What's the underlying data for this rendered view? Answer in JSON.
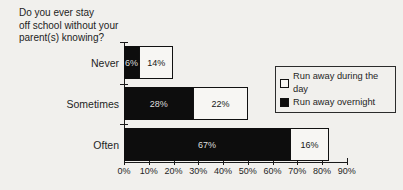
{
  "title": "Do you ever stay\noff school without your\nparent(s) knowing?",
  "legend": {
    "items": [
      {
        "label": "Run away during the day",
        "swatch_fill": "#f7f6f3"
      },
      {
        "label": "Run away overnight",
        "swatch_fill": "#0d0d0d"
      }
    ]
  },
  "colors": {
    "background": "#f1f0ed",
    "bar_overnight": "#0d0d0d",
    "bar_day": "#f7f6f3",
    "bar_border": "#111111",
    "axis": "#1a1a1a",
    "text": "#1c1c1c",
    "label_on_black": "#dedede",
    "label_on_white": "#161616"
  },
  "chart_data": {
    "type": "bar",
    "orientation": "horizontal",
    "stacked": true,
    "title": "Do you ever stay off school without your parent(s) knowing?",
    "categories": [
      "Never",
      "Sometimes",
      "Often"
    ],
    "series": [
      {
        "name": "Run away overnight",
        "fill": "black",
        "values": [
          6,
          28,
          67
        ],
        "labels": [
          "6%",
          "28%",
          "67%"
        ]
      },
      {
        "name": "Run away during the day",
        "fill": "white",
        "values": [
          14,
          22,
          16
        ],
        "labels": [
          "14%",
          "22%",
          "16%"
        ]
      }
    ],
    "xlim": [
      0,
      90
    ],
    "x_ticks": [
      "0%",
      "10%",
      "20%",
      "30%",
      "40%",
      "50%",
      "60%",
      "70%",
      "80%",
      "90%"
    ],
    "grid": false,
    "value_labels": true,
    "legend_position": "right"
  }
}
